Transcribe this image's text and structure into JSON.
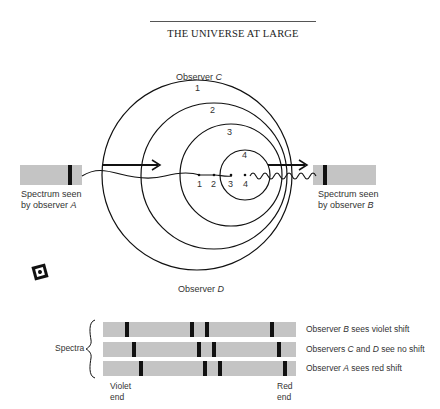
{
  "header": {
    "title": "THE UNIVERSE AT LARGE"
  },
  "diagram": {
    "observer_c": {
      "text": "Observer ",
      "letter": "C"
    },
    "observer_d": {
      "text": "Observer ",
      "letter": "D"
    },
    "wavefront_labels": [
      "1",
      "2",
      "3",
      "4"
    ],
    "source_position_labels": [
      "1",
      "2",
      "3",
      "4"
    ],
    "spectrum_a": {
      "line1": "Spectrum seen",
      "line2": "by observer ",
      "letter": "A"
    },
    "spectrum_b": {
      "line1": "Spectrum seen",
      "line2": "by observer ",
      "letter": "B"
    }
  },
  "spectra": {
    "group_label": "Spectra",
    "rows": [
      {
        "pre": "Observer ",
        "letter": "B",
        "post": " sees violet shift"
      },
      {
        "pre": "Observers ",
        "letter": "C",
        "mid": " and ",
        "letter2": "D",
        "post": " see no shift"
      },
      {
        "pre": "Observer ",
        "letter": "A",
        "post": " sees red shift"
      }
    ],
    "violet_end": {
      "line1": "Violet",
      "line2": "end"
    },
    "red_end": {
      "line1": "Red",
      "line2": "end"
    }
  },
  "colors": {
    "spectrum_bar": "#c4c4c4",
    "line": "#111111"
  }
}
